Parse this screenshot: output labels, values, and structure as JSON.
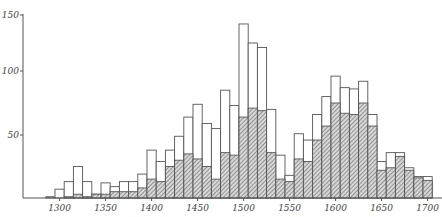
{
  "chart_data": {
    "type": "bar",
    "subtype": "overlaid histogram (open total bars with hatched subset)",
    "title": "",
    "xlabel": "",
    "ylabel": "",
    "ylim": [
      0,
      150
    ],
    "xlim": [
      1285,
      1705
    ],
    "grid": false,
    "legend": null,
    "x_ticks": [
      1300,
      1350,
      1400,
      1450,
      1500,
      1550,
      1600,
      1650,
      1700
    ],
    "y_ticks": [
      50,
      100,
      150
    ],
    "bin_width_years": 10,
    "categories": [
      1290,
      1300,
      1310,
      1320,
      1330,
      1340,
      1350,
      1360,
      1370,
      1380,
      1390,
      1400,
      1410,
      1420,
      1430,
      1440,
      1450,
      1460,
      1470,
      1480,
      1490,
      1500,
      1510,
      1520,
      1530,
      1540,
      1550,
      1560,
      1570,
      1580,
      1590,
      1600,
      1610,
      1620,
      1630,
      1640,
      1650,
      1660,
      1670,
      1680,
      1690,
      1700
    ],
    "series": [
      {
        "name": "total (open bars)",
        "values": [
          1,
          7,
          13,
          25,
          13,
          3,
          12,
          9,
          13,
          13,
          19,
          38,
          29,
          38,
          49,
          64,
          74,
          59,
          55,
          85,
          73,
          142,
          125,
          121,
          70,
          34,
          18,
          51,
          46,
          66,
          80,
          96,
          87,
          86,
          92,
          66,
          29,
          36,
          36,
          24,
          17,
          17
        ]
      },
      {
        "name": "subset (hatched bars)",
        "values": [
          0,
          0,
          1,
          3,
          1,
          3,
          3,
          5,
          5,
          5,
          8,
          15,
          13,
          25,
          30,
          35,
          31,
          25,
          15,
          36,
          34,
          64,
          71,
          69,
          36,
          15,
          13,
          31,
          29,
          46,
          57,
          75,
          67,
          66,
          75,
          57,
          22,
          24,
          33,
          22,
          16,
          14
        ]
      }
    ]
  }
}
